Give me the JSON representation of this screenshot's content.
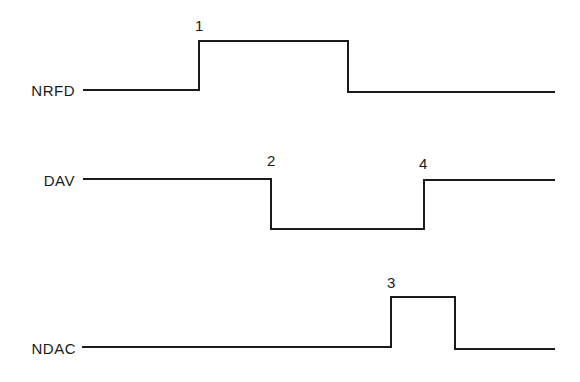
{
  "diagram": {
    "type": "timing-diagram",
    "stroke_color": "#1a1a1a",
    "background": "#ffffff",
    "signals": [
      {
        "name": "NRFD",
        "label_pos": [
          75,
          96
        ],
        "points": "83,90 199,90 199,41 348,41 348,92 555,92",
        "event": {
          "label": "1",
          "pos": [
            195,
            31
          ]
        }
      },
      {
        "name": "DAV",
        "label_pos": [
          75,
          186
        ],
        "points": "83,179 271,179 271,229 424,229 424,180 555,180",
        "events": [
          {
            "label": "2",
            "pos": [
              267,
              166
            ]
          },
          {
            "label": "4",
            "pos": [
              419,
              169
            ]
          }
        ]
      },
      {
        "name": "NDAC",
        "label_pos": [
          76,
          354
        ],
        "points": "82,347 391,347 391,297 455,297 455,349 555,349",
        "event": {
          "label": "3",
          "pos": [
            387,
            288
          ]
        }
      }
    ]
  }
}
